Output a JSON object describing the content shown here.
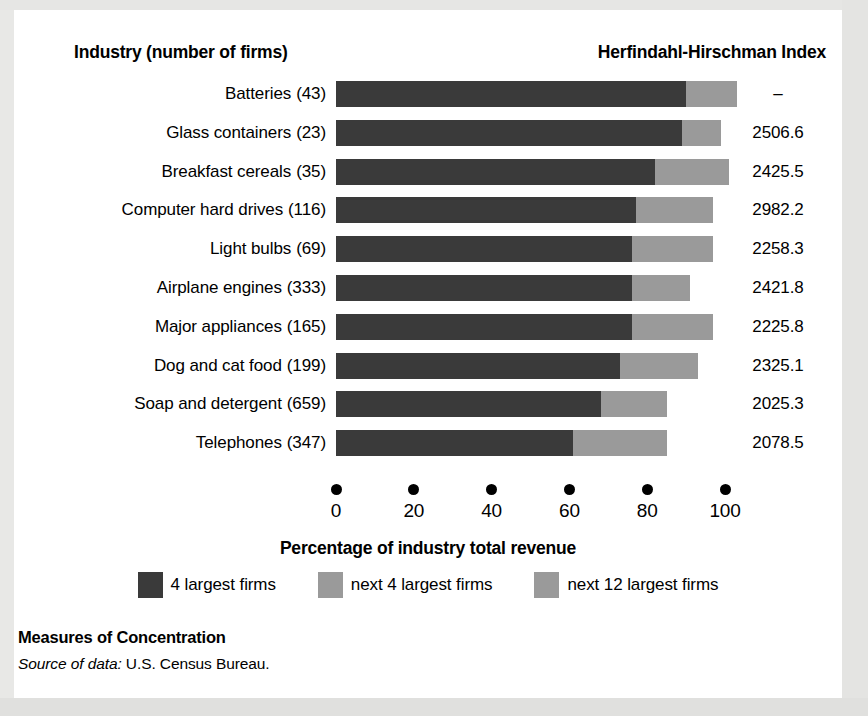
{
  "figure": {
    "column_header_left": "Industry (number of firms)",
    "column_header_right": "Herfindahl-Hirschman Index",
    "footer_title": "Measures of Concentration",
    "source_label": "Source of data:",
    "source_text": "U.S. Census Bureau."
  },
  "colors": {
    "series1": "#3a3a3a",
    "series2": "#9a9a9a",
    "series3": "#9a9a9a",
    "background": "#ffffff",
    "text": "#000000"
  },
  "chart_data": {
    "type": "bar",
    "orientation": "horizontal",
    "stacked": true,
    "title": "Measures of Concentration",
    "xlabel": "Percentage of industry total revenue",
    "ylabel": "Industry (number of firms)",
    "xlim": [
      0,
      100
    ],
    "xticks": [
      0,
      20,
      40,
      60,
      80,
      100
    ],
    "xticklabels": [
      "0",
      "20",
      "40",
      "60",
      "80",
      "100"
    ],
    "grid": false,
    "legend_position": "bottom",
    "categories": [
      "Batteries",
      "Glass containers",
      "Breakfast cereals",
      "Computer hard drives",
      "Light bulbs",
      "Airplane engines",
      "Major appliances",
      "Dog and cat food",
      "Soap and detergent",
      "Telephones"
    ],
    "number_of_firms": [
      43,
      23,
      35,
      116,
      69,
      333,
      165,
      199,
      659,
      347
    ],
    "herfindahl_hirschman_index": [
      "–",
      "2506.6",
      "2425.5",
      "2982.2",
      "2258.3",
      "2421.8",
      "2225.8",
      "2325.1",
      "2025.3",
      "2078.5"
    ],
    "series": [
      {
        "name": "4 largest firms",
        "color": "#3a3a3a",
        "values": [
          90,
          89,
          82,
          77,
          76,
          76,
          76,
          73,
          68,
          61
        ]
      },
      {
        "name": "next 4 largest firms",
        "color": "#9a9a9a",
        "values": [
          13,
          10,
          19,
          16,
          15,
          15,
          21,
          20,
          17,
          24
        ]
      },
      {
        "name": "next 12 largest firms",
        "color": "#9a9a9a",
        "values": [
          0,
          0,
          0,
          0,
          0,
          0,
          0,
          0,
          0,
          0
        ]
      }
    ],
    "rows": [
      {
        "label": "Batteries",
        "firms": "(43)",
        "s1": 90,
        "s2": 13,
        "s3": 0,
        "hhi": "–"
      },
      {
        "label": "Glass containers",
        "firms": "(23)",
        "s1": 89,
        "s2": 10,
        "s3": 0,
        "hhi": "2506.6"
      },
      {
        "label": "Breakfast cereals",
        "firms": "(35)",
        "s1": 82,
        "s2": 19,
        "s3": 0,
        "hhi": "2425.5"
      },
      {
        "label": "Computer hard drives",
        "firms": "(116)",
        "s1": 77,
        "s2": 20,
        "s3": 0,
        "hhi": "2982.2"
      },
      {
        "label": "Light bulbs",
        "firms": "(69)",
        "s1": 76,
        "s2": 21,
        "s3": 0,
        "hhi": "2258.3"
      },
      {
        "label": "Airplane engines",
        "firms": "(333)",
        "s1": 76,
        "s2": 15,
        "s3": 0,
        "hhi": "2421.8"
      },
      {
        "label": "Major appliances",
        "firms": "(165)",
        "s1": 76,
        "s2": 21,
        "s3": 0,
        "hhi": "2225.8"
      },
      {
        "label": "Dog and cat food",
        "firms": "(199)",
        "s1": 73,
        "s2": 20,
        "s3": 0,
        "hhi": "2325.1"
      },
      {
        "label": "Soap and detergent",
        "firms": "(659)",
        "s1": 68,
        "s2": 17,
        "s3": 0,
        "hhi": "2025.3"
      },
      {
        "label": "Telephones",
        "firms": "(347)",
        "s1": 61,
        "s2": 24,
        "s3": 0,
        "hhi": "2078.5"
      }
    ],
    "legend": [
      {
        "label": "4 largest firms",
        "color": "#3a3a3a"
      },
      {
        "label": "next 4 largest firms",
        "color": "#9a9a9a"
      },
      {
        "label": "next 12 largest firms",
        "color": "#9a9a9a"
      }
    ]
  }
}
